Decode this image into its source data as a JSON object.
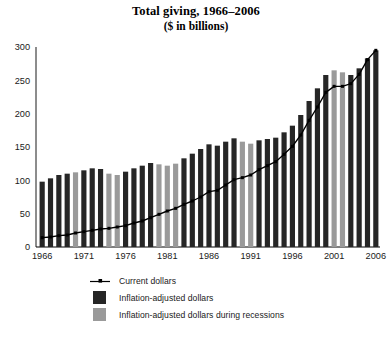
{
  "chart_data": {
    "type": "bar",
    "title": "Total giving, 1966–2006",
    "subtitle": "($ in billions)",
    "xlabel": "",
    "ylabel": "",
    "ylim": [
      0,
      300
    ],
    "yticks": [
      0,
      50,
      100,
      150,
      200,
      250,
      300
    ],
    "xticks": [
      1966,
      1971,
      1976,
      1981,
      1986,
      1991,
      1996,
      2001,
      2006
    ],
    "grid": false,
    "legend_position": "bottom",
    "colors": {
      "inflation_adjusted": "#262626",
      "recession": "#9a9a9a",
      "current_dollars_line": "#000000",
      "axis": "#000000",
      "background": "#ffffff"
    },
    "categories": [
      1966,
      1967,
      1968,
      1969,
      1970,
      1971,
      1972,
      1973,
      1974,
      1975,
      1976,
      1977,
      1978,
      1979,
      1980,
      1981,
      1982,
      1983,
      1984,
      1985,
      1986,
      1987,
      1988,
      1989,
      1990,
      1991,
      1992,
      1993,
      1994,
      1995,
      1996,
      1997,
      1998,
      1999,
      2000,
      2001,
      2002,
      2003,
      2004,
      2005,
      2006
    ],
    "recession_years": [
      1970,
      1974,
      1975,
      1980,
      1981,
      1982,
      1990,
      1991,
      2001,
      2002
    ],
    "series": [
      {
        "name": "Inflation-adjusted dollars",
        "type": "bar",
        "values": [
          98,
          103,
          108,
          110,
          112,
          115,
          118,
          117,
          110,
          108,
          113,
          118,
          122,
          126,
          124,
          122,
          125,
          133,
          140,
          147,
          154,
          152,
          158,
          163,
          158,
          155,
          160,
          162,
          164,
          172,
          182,
          198,
          219,
          238,
          258,
          265,
          262,
          258,
          268,
          283,
          295
        ]
      },
      {
        "name": "Current dollars",
        "type": "line",
        "values": [
          14,
          15,
          17,
          18,
          21,
          23,
          25,
          27,
          28,
          30,
          32,
          36,
          39,
          44,
          49,
          54,
          58,
          64,
          69,
          75,
          83,
          85,
          93,
          101,
          104,
          108,
          116,
          122,
          128,
          139,
          151,
          168,
          190,
          210,
          232,
          241,
          241,
          245,
          259,
          281,
          295
        ]
      }
    ]
  },
  "legend": {
    "items": [
      {
        "label": "Current dollars",
        "key": "line-marker"
      },
      {
        "label": "Inflation-adjusted dollars",
        "key": "dark-swatch"
      },
      {
        "label": "Inflation-adjusted dollars during recessions",
        "key": "gray-swatch"
      }
    ]
  }
}
